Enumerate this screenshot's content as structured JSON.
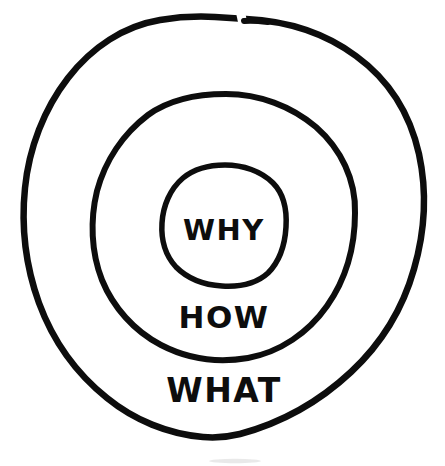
{
  "diagram": {
    "style": "hand-drawn concentric circles",
    "background_color": "#ffffff",
    "stroke_color": "#0d0d0d",
    "rings": [
      {
        "id": "outer",
        "label": "WHAT",
        "level": 3,
        "label_x": 224,
        "label_y": 392,
        "font_size": 33,
        "center_x": 224,
        "center_y": 233,
        "radius_x": 199,
        "radius_y": 214,
        "stroke_width": 6.5,
        "has_gap_at_top": true
      },
      {
        "id": "middle",
        "label": "HOW",
        "level": 2,
        "label_x": 224,
        "label_y": 318,
        "font_size": 31,
        "center_x": 225,
        "center_y": 227,
        "radius_x": 129,
        "radius_y": 133,
        "stroke_width": 6.0,
        "has_gap_at_top": false
      },
      {
        "id": "inner",
        "label": "WHY",
        "level": 1,
        "label_x": 224,
        "label_y": 231,
        "font_size": 29,
        "center_x": 224,
        "center_y": 225,
        "radius_x": 62,
        "radius_y": 60,
        "stroke_width": 5.5,
        "has_gap_at_top": false
      }
    ]
  }
}
